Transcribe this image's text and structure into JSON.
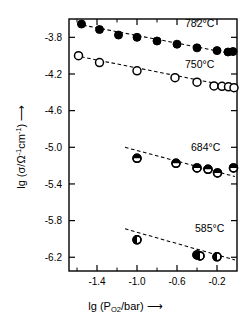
{
  "chart_data": {
    "type": "scatter",
    "title": "",
    "xlabel": "lg (P_O2/bar)",
    "ylabel": "lg (sigma/Ohm^-1 cm^-1)",
    "xlim": [
      -1.68,
      0.0
    ],
    "ylim": [
      -6.35,
      -3.6
    ],
    "grid": false,
    "legend_position": "inline-right",
    "xticks": [
      -1.4,
      -1.0,
      -0.6,
      -0.2
    ],
    "xtick_labels": [
      "-1.4",
      "-1.0",
      "-0.6",
      "-0.2"
    ],
    "xminor_ticks": [
      -1.6,
      -1.2,
      -0.8,
      -0.4,
      0.0
    ],
    "yticks": [
      -3.8,
      -4.2,
      -4.6,
      -5.0,
      -5.4,
      -5.8,
      -6.2
    ],
    "ytick_labels": [
      "-3.8",
      "-4.2",
      "-4.6",
      "-5.0",
      "-5.4",
      "-5.8",
      "-6.2"
    ],
    "series": [
      {
        "name": "782°C",
        "label": "782°C",
        "marker": "filled-circle",
        "color": "#000000",
        "fit_line": {
          "x": [
            -1.6,
            -0.02
          ],
          "y": [
            -3.655,
            -3.985
          ]
        },
        "points": [
          {
            "x": -1.555,
            "y": -3.655
          },
          {
            "x": -1.375,
            "y": -3.715
          },
          {
            "x": -1.185,
            "y": -3.775
          },
          {
            "x": -1.0,
            "y": -3.8
          },
          {
            "x": -0.8,
            "y": -3.84
          },
          {
            "x": -0.6,
            "y": -3.875
          },
          {
            "x": -0.4,
            "y": -3.915
          },
          {
            "x": -0.2,
            "y": -3.945
          },
          {
            "x": -0.09,
            "y": -3.96
          },
          {
            "x": -0.04,
            "y": -3.955
          }
        ]
      },
      {
        "name": "750°C",
        "label": "750°C",
        "marker": "open-circle",
        "color": "#000000",
        "fit_line": {
          "x": [
            -1.62,
            -0.02
          ],
          "y": [
            -4.0,
            -4.345
          ]
        },
        "points": [
          {
            "x": -1.585,
            "y": -4.0
          },
          {
            "x": -1.375,
            "y": -4.075
          },
          {
            "x": -1.0,
            "y": -4.165
          },
          {
            "x": -0.62,
            "y": -4.24
          },
          {
            "x": -0.4,
            "y": -4.29
          },
          {
            "x": -0.23,
            "y": -4.33
          },
          {
            "x": -0.15,
            "y": -4.335
          },
          {
            "x": -0.085,
            "y": -4.34
          },
          {
            "x": -0.03,
            "y": -4.35
          }
        ]
      },
      {
        "name": "684°C",
        "label": "684°C",
        "marker": "half-top-circle",
        "color": "#000000",
        "fit_line": {
          "x": [
            -1.12,
            -0.02
          ],
          "y": [
            -5.0,
            -5.32
          ]
        },
        "points": [
          {
            "x": -1.0,
            "y": -5.12
          },
          {
            "x": -0.61,
            "y": -5.175
          },
          {
            "x": -0.4,
            "y": -5.225
          },
          {
            "x": -0.29,
            "y": -5.24
          },
          {
            "x": -0.195,
            "y": -5.28
          },
          {
            "x": -0.035,
            "y": -5.225
          }
        ]
      },
      {
        "name": "585°C",
        "label": "585°C",
        "marker": "half-left-circle",
        "color": "#000000",
        "fit_line": {
          "x": [
            -1.12,
            -0.02
          ],
          "y": [
            -5.89,
            -6.23
          ]
        },
        "points": [
          {
            "x": -1.0,
            "y": -6.01
          },
          {
            "x": -0.4,
            "y": -6.175
          },
          {
            "x": -0.37,
            "y": -6.185
          },
          {
            "x": -0.2,
            "y": -6.195
          }
        ]
      }
    ],
    "annotations": [
      {
        "text": "782°C",
        "x": -0.52,
        "y": -3.69
      },
      {
        "text": "750°C",
        "x": -0.52,
        "y": -4.13
      },
      {
        "text": "684°C",
        "x": -0.46,
        "y": -5.04
      },
      {
        "text": "585°C",
        "x": -0.42,
        "y": -5.92
      }
    ]
  },
  "axes": {
    "x_title_main": "lg (P",
    "x_title_sub": "O",
    "x_title_sub2": "2",
    "x_title_tail": "/bar)",
    "y_title_main": "lg (σ/Ω",
    "y_title_sup1": "-1",
    "y_title_mid": "cm",
    "y_title_sup2": "-1",
    "y_title_tail": ")",
    "x_arrow": "⟶",
    "y_arrow": "⟶"
  }
}
